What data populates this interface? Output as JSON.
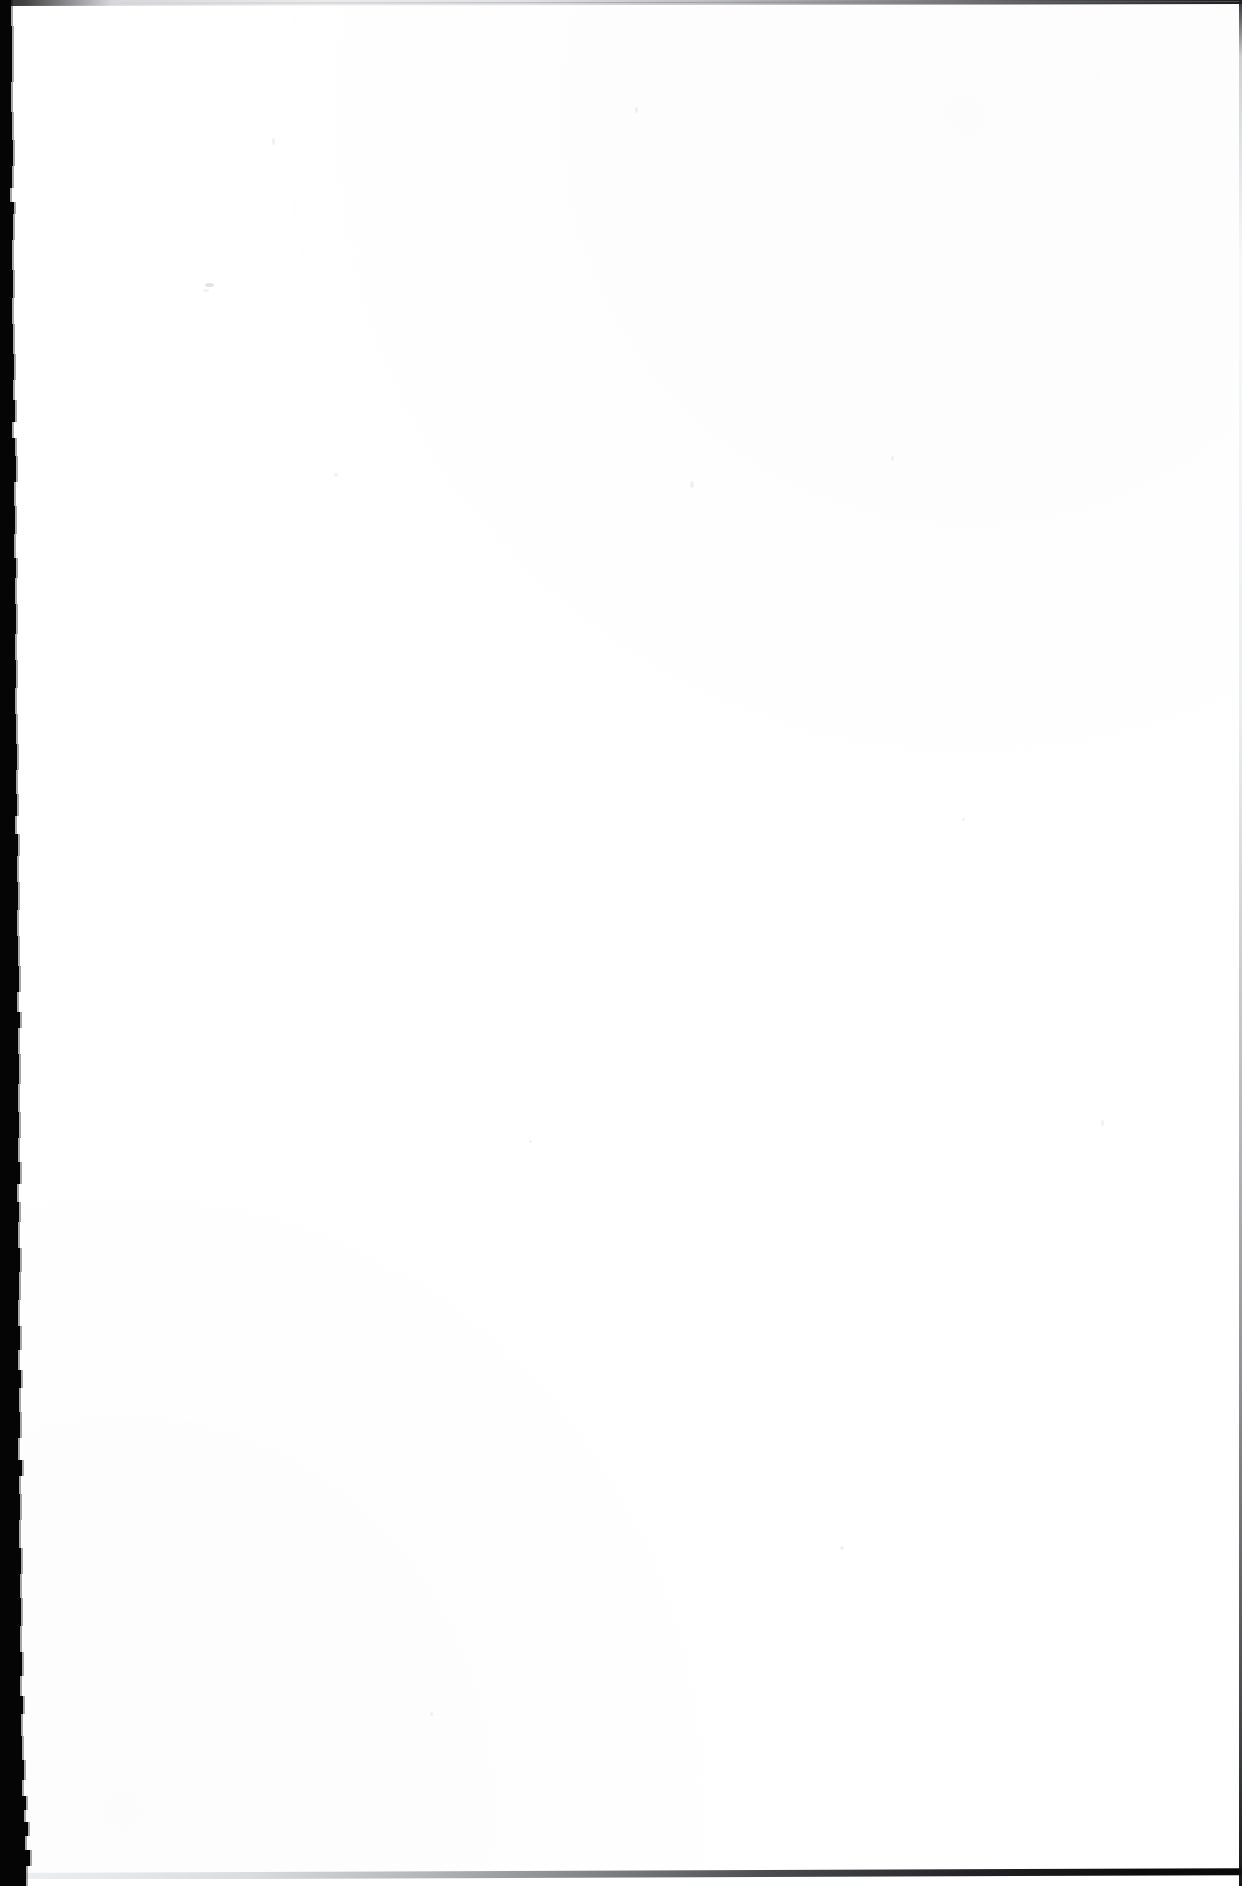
{
  "document": {
    "kind": "scanned-page",
    "page_label": "",
    "body_text": "",
    "is_blank": true,
    "orientation": "portrait",
    "page_width": 1242,
    "page_height": 1886
  },
  "colors": {
    "paper": "#ffffff",
    "scan_border": "#050506",
    "edge_rule_dark": "#141416",
    "edge_rule_light": "#c8cace"
  },
  "edges": {
    "left_border_label": "scan-shadow-left",
    "top_rule_label": "page-edge-top",
    "bottom_rule_label": "page-edge-bottom",
    "right_rule_label": "page-edge-right"
  },
  "artifacts": {
    "speckles": [
      {
        "x": 272,
        "y": 138,
        "w": 3,
        "h": 7,
        "dark": false
      },
      {
        "x": 635,
        "y": 107,
        "w": 3,
        "h": 6,
        "dark": false
      },
      {
        "x": 205,
        "y": 283,
        "w": 9,
        "h": 4,
        "dark": true
      },
      {
        "x": 203,
        "y": 289,
        "w": 6,
        "h": 3,
        "dark": false
      },
      {
        "x": 334,
        "y": 473,
        "w": 4,
        "h": 4,
        "dark": false
      },
      {
        "x": 891,
        "y": 456,
        "w": 3,
        "h": 5,
        "dark": false
      },
      {
        "x": 690,
        "y": 481,
        "w": 4,
        "h": 7,
        "dark": false
      },
      {
        "x": 529,
        "y": 1140,
        "w": 3,
        "h": 3,
        "dark": false
      },
      {
        "x": 840,
        "y": 1546,
        "w": 4,
        "h": 4,
        "dark": false
      },
      {
        "x": 1101,
        "y": 1120,
        "w": 3,
        "h": 6,
        "dark": false
      },
      {
        "x": 430,
        "y": 1712,
        "w": 3,
        "h": 4,
        "dark": false
      },
      {
        "x": 962,
        "y": 818,
        "w": 3,
        "h": 3,
        "dark": false
      }
    ],
    "left_border_bands": [
      {
        "top": 0,
        "height": 26,
        "width": 11
      },
      {
        "top": 26,
        "height": 22,
        "width": 12
      },
      {
        "top": 48,
        "height": 34,
        "width": 12
      },
      {
        "top": 82,
        "height": 30,
        "width": 11
      },
      {
        "top": 112,
        "height": 28,
        "width": 12
      },
      {
        "top": 140,
        "height": 26,
        "width": 13
      },
      {
        "top": 166,
        "height": 22,
        "width": 12
      },
      {
        "top": 188,
        "height": 14,
        "width": 10
      },
      {
        "top": 202,
        "height": 12,
        "width": 14
      },
      {
        "top": 214,
        "height": 26,
        "width": 13
      },
      {
        "top": 240,
        "height": 30,
        "width": 12
      },
      {
        "top": 270,
        "height": 28,
        "width": 13
      },
      {
        "top": 298,
        "height": 26,
        "width": 12
      },
      {
        "top": 324,
        "height": 30,
        "width": 13
      },
      {
        "top": 354,
        "height": 26,
        "width": 14
      },
      {
        "top": 380,
        "height": 20,
        "width": 13
      },
      {
        "top": 400,
        "height": 22,
        "width": 15
      },
      {
        "top": 422,
        "height": 16,
        "width": 12
      },
      {
        "top": 438,
        "height": 18,
        "width": 15
      },
      {
        "top": 456,
        "height": 26,
        "width": 16
      },
      {
        "top": 482,
        "height": 24,
        "width": 14
      },
      {
        "top": 506,
        "height": 28,
        "width": 15
      },
      {
        "top": 534,
        "height": 24,
        "width": 14
      },
      {
        "top": 558,
        "height": 20,
        "width": 16
      },
      {
        "top": 578,
        "height": 26,
        "width": 15
      },
      {
        "top": 604,
        "height": 30,
        "width": 16
      },
      {
        "top": 634,
        "height": 26,
        "width": 15
      },
      {
        "top": 660,
        "height": 28,
        "width": 16
      },
      {
        "top": 688,
        "height": 26,
        "width": 15
      },
      {
        "top": 714,
        "height": 30,
        "width": 16
      },
      {
        "top": 744,
        "height": 26,
        "width": 17
      },
      {
        "top": 770,
        "height": 24,
        "width": 16
      },
      {
        "top": 794,
        "height": 22,
        "width": 17
      },
      {
        "top": 816,
        "height": 18,
        "width": 15
      },
      {
        "top": 834,
        "height": 22,
        "width": 18
      },
      {
        "top": 856,
        "height": 26,
        "width": 17
      },
      {
        "top": 882,
        "height": 28,
        "width": 18
      },
      {
        "top": 910,
        "height": 26,
        "width": 17
      },
      {
        "top": 936,
        "height": 30,
        "width": 18
      },
      {
        "top": 966,
        "height": 26,
        "width": 19
      },
      {
        "top": 992,
        "height": 20,
        "width": 17
      },
      {
        "top": 1012,
        "height": 16,
        "width": 20
      },
      {
        "top": 1028,
        "height": 26,
        "width": 18
      },
      {
        "top": 1054,
        "height": 30,
        "width": 19
      },
      {
        "top": 1084,
        "height": 28,
        "width": 18
      },
      {
        "top": 1112,
        "height": 26,
        "width": 19
      },
      {
        "top": 1138,
        "height": 24,
        "width": 18
      },
      {
        "top": 1162,
        "height": 22,
        "width": 20
      },
      {
        "top": 1184,
        "height": 18,
        "width": 17
      },
      {
        "top": 1202,
        "height": 20,
        "width": 19
      },
      {
        "top": 1222,
        "height": 26,
        "width": 18
      },
      {
        "top": 1248,
        "height": 24,
        "width": 20
      },
      {
        "top": 1272,
        "height": 28,
        "width": 19
      },
      {
        "top": 1300,
        "height": 26,
        "width": 18
      },
      {
        "top": 1326,
        "height": 24,
        "width": 20
      },
      {
        "top": 1350,
        "height": 20,
        "width": 18
      },
      {
        "top": 1370,
        "height": 18,
        "width": 21
      },
      {
        "top": 1388,
        "height": 24,
        "width": 19
      },
      {
        "top": 1412,
        "height": 26,
        "width": 20
      },
      {
        "top": 1438,
        "height": 22,
        "width": 18
      },
      {
        "top": 1460,
        "height": 16,
        "width": 22
      },
      {
        "top": 1476,
        "height": 18,
        "width": 19
      },
      {
        "top": 1494,
        "height": 26,
        "width": 20
      },
      {
        "top": 1520,
        "height": 28,
        "width": 19
      },
      {
        "top": 1548,
        "height": 26,
        "width": 21
      },
      {
        "top": 1574,
        "height": 24,
        "width": 20
      },
      {
        "top": 1598,
        "height": 28,
        "width": 21
      },
      {
        "top": 1626,
        "height": 26,
        "width": 20
      },
      {
        "top": 1652,
        "height": 24,
        "width": 22
      },
      {
        "top": 1676,
        "height": 20,
        "width": 20
      },
      {
        "top": 1696,
        "height": 18,
        "width": 23
      },
      {
        "top": 1714,
        "height": 22,
        "width": 21
      },
      {
        "top": 1736,
        "height": 24,
        "width": 22
      },
      {
        "top": 1760,
        "height": 20,
        "width": 24
      },
      {
        "top": 1780,
        "height": 16,
        "width": 22
      },
      {
        "top": 1796,
        "height": 14,
        "width": 26
      },
      {
        "top": 1810,
        "height": 12,
        "width": 24
      },
      {
        "top": 1822,
        "height": 14,
        "width": 28
      },
      {
        "top": 1836,
        "height": 14,
        "width": 25
      },
      {
        "top": 1850,
        "height": 16,
        "width": 30
      },
      {
        "top": 1866,
        "height": 20,
        "width": 26
      }
    ]
  }
}
